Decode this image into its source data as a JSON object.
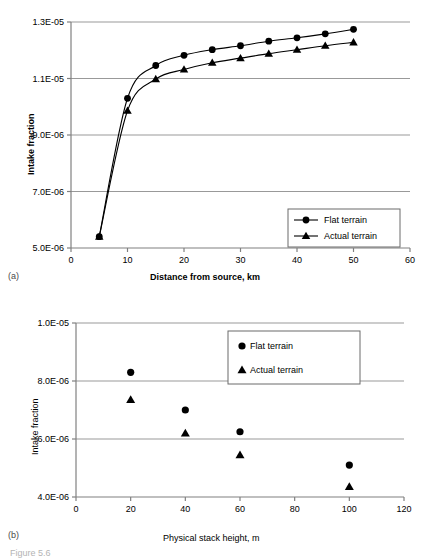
{
  "figure": {
    "caption_partial": "Figure 5.6"
  },
  "panel_a": {
    "tag": "(a)",
    "xlabel": "Distance from source, km",
    "ylabel": "Intake fraction",
    "legend": [
      {
        "label": "Flat terrain",
        "marker": "circle-marker-icon"
      },
      {
        "label": "Actual terrain",
        "marker": "triangle-marker-icon"
      }
    ]
  },
  "panel_b": {
    "tag": "(b)",
    "xlabel": "Physical stack height, m",
    "ylabel": "Intake fraction",
    "legend": [
      {
        "label": "Flat terrain",
        "marker": "circle-marker-icon"
      },
      {
        "label": "Actual terrain",
        "marker": "triangle-marker-icon"
      }
    ]
  },
  "colors": {
    "series": "#000000",
    "gridline": "#999999",
    "axis": "#808080",
    "background": "#ffffff"
  },
  "chart_data": [
    {
      "type": "line",
      "id": "panel-a",
      "title": "",
      "xlabel": "Distance from source, km",
      "ylabel": "Intake fraction",
      "xlim": [
        0,
        60
      ],
      "ylim": [
        5e-06,
        1.3e-05
      ],
      "xticks": [
        0,
        10,
        20,
        30,
        40,
        50,
        60
      ],
      "xtick_labels": [
        "0",
        "10",
        "20",
        "30",
        "40",
        "50",
        "60"
      ],
      "yticks": [
        5e-06,
        7e-06,
        9e-06,
        1.1e-05,
        1.3e-05
      ],
      "ytick_labels": [
        "5.0E-06",
        "7.0E-06",
        "9.0E-06",
        "1.1E-05",
        "1.3E-05"
      ],
      "grid": true,
      "grid_axis": "y",
      "legend_position": "lower right",
      "x": [
        5,
        10,
        15,
        20,
        25,
        30,
        35,
        40,
        45,
        50
      ],
      "series": [
        {
          "name": "Flat terrain",
          "marker": "circle",
          "values": [
            5.4e-06,
            1.03e-05,
            1.146e-05,
            1.182e-05,
            1.202e-05,
            1.216e-05,
            1.232e-05,
            1.244e-05,
            1.258e-05,
            1.274e-05
          ]
        },
        {
          "name": "Actual terrain",
          "marker": "triangle",
          "values": [
            5.4e-06,
            9.86e-06,
            1.098e-05,
            1.132e-05,
            1.156e-05,
            1.172e-05,
            1.188e-05,
            1.202e-05,
            1.216e-05,
            1.228e-05
          ]
        }
      ]
    },
    {
      "type": "scatter",
      "id": "panel-b",
      "title": "",
      "xlabel": "Physical stack height, m",
      "ylabel": "Intake fraction",
      "xlim": [
        0,
        120
      ],
      "ylim": [
        4e-06,
        1e-05
      ],
      "xticks": [
        0,
        20,
        40,
        60,
        80,
        100,
        120
      ],
      "xtick_labels": [
        "0",
        "20",
        "40",
        "60",
        "80",
        "100",
        "120"
      ],
      "yticks": [
        4e-06,
        6e-06,
        8e-06,
        1e-05
      ],
      "ytick_labels": [
        "4.0E-06",
        "6.0E-06",
        "8.0E-06",
        "1.0E-05"
      ],
      "grid": true,
      "grid_axis": "y",
      "legend_position": "upper right",
      "x": [
        20,
        40,
        60,
        100
      ],
      "series": [
        {
          "name": "Flat terrain",
          "marker": "circle",
          "values": [
            8.3e-06,
            7e-06,
            6.25e-06,
            5.1e-06
          ]
        },
        {
          "name": "Actual terrain",
          "marker": "triangle",
          "values": [
            7.35e-06,
            6.2e-06,
            5.45e-06,
            4.35e-06
          ]
        }
      ]
    }
  ]
}
